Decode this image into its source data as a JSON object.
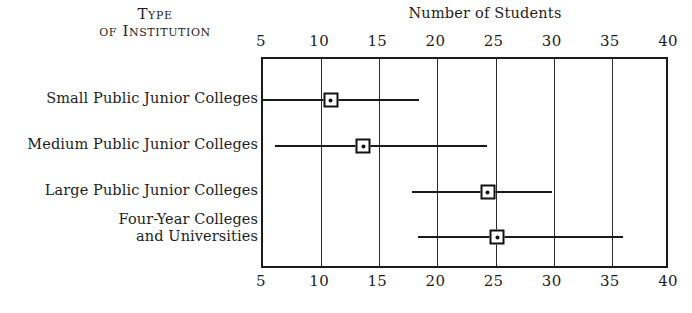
{
  "header": {
    "column_head_line1": "Type",
    "column_head_line2": "of Institution"
  },
  "chart_data": {
    "type": "bar",
    "subtype": "range-plot-with-median-marker",
    "title": "Number of Students",
    "xlabel": "Number of Students",
    "ylabel": "Type of Institution",
    "xlim": [
      5,
      40
    ],
    "xticks": [
      5,
      10,
      15,
      20,
      25,
      30,
      35,
      40
    ],
    "xtick_labels": [
      "5",
      "10",
      "15",
      "20",
      "25",
      "30",
      "35",
      "40"
    ],
    "xticks_top": [
      "5",
      "10",
      "15",
      "20",
      "25",
      "30",
      "35",
      "40"
    ],
    "xticks_bottom": [
      "5",
      "10",
      "15",
      "20",
      "25",
      "30",
      "35",
      "40"
    ],
    "grid": true,
    "legend": "none",
    "categories": [
      "Small Public Junior Colleges",
      "Medium Public Junior Colleges",
      "Large Public Junior Colleges",
      "Four-Year Colleges and Universities"
    ],
    "series": [
      {
        "name": "range_low",
        "values": [
          5.0,
          6.2,
          18.0,
          18.5
        ]
      },
      {
        "name": "median",
        "values": [
          11.0,
          13.8,
          24.5,
          25.3
        ]
      },
      {
        "name": "range_high",
        "values": [
          18.6,
          24.4,
          30.0,
          36.1
        ]
      }
    ],
    "rows": [
      {
        "label_line1": "Small Public Junior Colleges",
        "label_line2": "",
        "low": 5.0,
        "median": 11.0,
        "high": 18.6
      },
      {
        "label_line1": "Medium Public Junior Colleges",
        "label_line2": "",
        "low": 6.2,
        "median": 13.8,
        "high": 24.4
      },
      {
        "label_line1": "Large Public Junior Colleges",
        "label_line2": "",
        "low": 18.0,
        "median": 24.5,
        "high": 30.0
      },
      {
        "label_line1": "Four-Year Colleges",
        "label_line2": "and Universities",
        "low": 18.5,
        "median": 25.3,
        "high": 36.1
      }
    ]
  },
  "colors": {
    "ink": "#1a1a1a",
    "paper": "#ffffff"
  }
}
